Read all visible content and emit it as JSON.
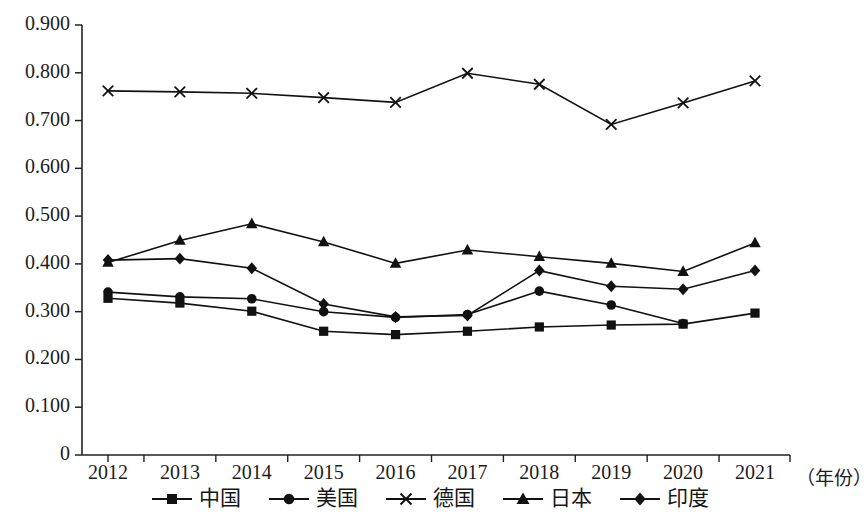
{
  "chart_data": {
    "type": "line",
    "title": "",
    "xlabel": "（年份）",
    "ylabel": "",
    "categories": [
      "2012",
      "2013",
      "2014",
      "2015",
      "2016",
      "2017",
      "2018",
      "2019",
      "2020",
      "2021"
    ],
    "ytick_labels": [
      "0.900",
      "0.800",
      "0.700",
      "0.600",
      "0.500",
      "0.400",
      "0.300",
      "0.200",
      "0.100",
      "0"
    ],
    "ytick_values": [
      0.9,
      0.8,
      0.7,
      0.6,
      0.5,
      0.4,
      0.3,
      0.2,
      0.1,
      0
    ],
    "ylim": [
      0,
      0.9
    ],
    "grid": false,
    "legend_position": "bottom",
    "series": [
      {
        "name": "中国",
        "marker": "square",
        "color": "#111111",
        "values": [
          0.328,
          0.318,
          0.301,
          0.259,
          0.252,
          0.259,
          0.268,
          0.272,
          0.274,
          0.297
        ]
      },
      {
        "name": "美国",
        "marker": "circle",
        "color": "#111111",
        "values": [
          0.341,
          0.331,
          0.327,
          0.3,
          0.288,
          0.294,
          0.343,
          0.314,
          0.275,
          null
        ]
      },
      {
        "name": "德国",
        "marker": "cross",
        "color": "#111111",
        "values": [
          0.762,
          0.76,
          0.757,
          0.748,
          0.738,
          0.799,
          0.776,
          0.692,
          0.737,
          0.783
        ]
      },
      {
        "name": "日本",
        "marker": "triangle",
        "color": "#111111",
        "values": [
          0.403,
          0.449,
          0.484,
          0.446,
          0.401,
          0.429,
          0.415,
          0.401,
          0.384,
          0.444
        ]
      },
      {
        "name": "印度",
        "marker": "diamond",
        "color": "#111111",
        "values": [
          0.408,
          0.411,
          0.391,
          0.316,
          0.289,
          0.292,
          0.386,
          0.353,
          0.347,
          0.386
        ]
      }
    ]
  },
  "legend": {
    "items": [
      {
        "label": "中国",
        "marker": "square"
      },
      {
        "label": "美国",
        "marker": "circle"
      },
      {
        "label": "德国",
        "marker": "cross"
      },
      {
        "label": "日本",
        "marker": "triangle"
      },
      {
        "label": "印度",
        "marker": "diamond"
      }
    ]
  },
  "axis": {
    "x_axis_title": "（年份）"
  }
}
